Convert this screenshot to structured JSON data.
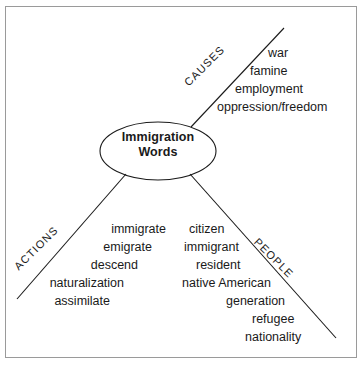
{
  "diagram": {
    "type": "concept-map",
    "center": {
      "line1": "Immigration",
      "line2": "Words"
    },
    "branches": [
      {
        "id": "causes",
        "label": "CAUSES",
        "direction": "upper-right",
        "words": [
          "war",
          "famine",
          "employment",
          "oppression/freedom"
        ]
      },
      {
        "id": "actions",
        "label": "ACTIONS",
        "direction": "lower-left",
        "words": [
          "immigrate",
          "emigrate",
          "descend",
          "naturalization",
          "assimilate"
        ]
      },
      {
        "id": "people",
        "label": "PEOPLE",
        "direction": "lower-right",
        "words": [
          "citizen",
          "immigrant",
          "resident",
          "native American",
          "generation",
          "refugee",
          "nationality"
        ]
      }
    ],
    "colors": {
      "background": "#ffffff",
      "border": "#9a9a9a",
      "stroke": "#1a1a1a",
      "text": "#1a1a1a"
    }
  }
}
